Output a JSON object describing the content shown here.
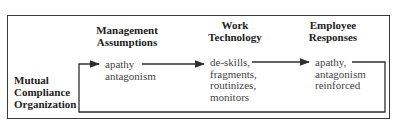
{
  "diagram": {
    "organization_label": [
      "Mutual",
      "Compliance",
      "Organization"
    ],
    "columns": [
      {
        "header": [
          "Management",
          "Assumptions"
        ],
        "items": [
          "apathy",
          "antagonism"
        ]
      },
      {
        "header": [
          "Work",
          "Technology"
        ],
        "items": [
          "de-skills,",
          "fragments,",
          "routinizes,",
          "monitors"
        ]
      },
      {
        "header": [
          "Employee",
          "Responses"
        ],
        "items": [
          "apathy,",
          "antagonism",
          "reinforced"
        ]
      }
    ],
    "colors": {
      "line": "#2f2f2f",
      "text": "#2a2a2a",
      "background": "#ffffff"
    }
  }
}
